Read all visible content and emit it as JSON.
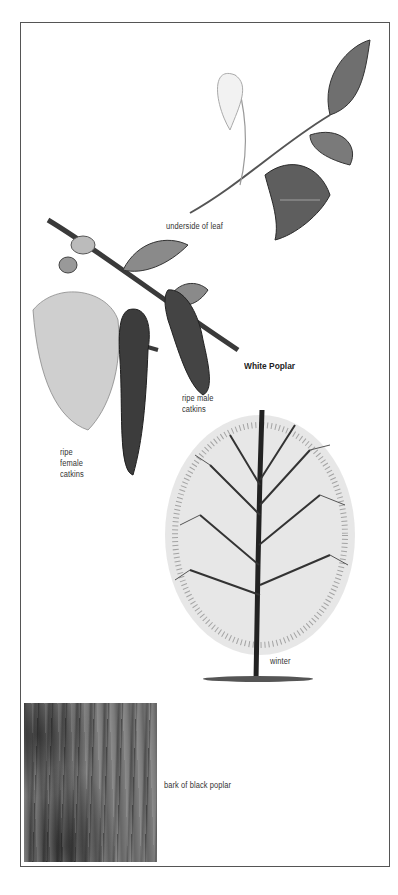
{
  "page": {
    "species_title": "White Poplar"
  },
  "illustrations": [
    {
      "id": "leaf-sprig",
      "caption": "underside of leaf"
    },
    {
      "id": "catkin-branch-male",
      "caption": "ripe male catkins"
    },
    {
      "id": "catkin-branch-female",
      "caption": "ripe female catkins"
    },
    {
      "id": "winter-tree",
      "caption": "winter"
    },
    {
      "id": "bark-photo",
      "caption": "bark of black poplar"
    }
  ],
  "captions": {
    "leaf": "underside of leaf",
    "male_line1": "ripe male",
    "male_line2": "catkins",
    "female_line1": "ripe",
    "female_line2": "female",
    "female_line3": "catkins",
    "winter": "winter",
    "bark": "bark of black poplar"
  },
  "colors": {
    "frame": "#555555",
    "text": "#333333",
    "ink": "#2a2a2a",
    "paper": "#ffffff"
  }
}
